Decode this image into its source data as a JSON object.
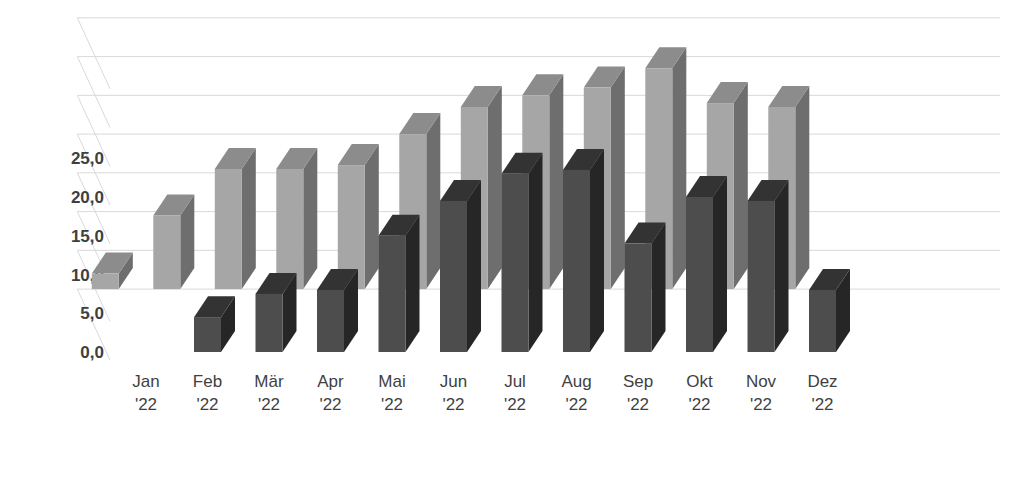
{
  "chart_data": {
    "type": "bar",
    "subtype": "3d-clustered-column-depth",
    "title": "",
    "subtitle": "",
    "xlabel": "",
    "ylabel": "",
    "categories": [
      "Jan\n'22",
      "Feb\n'22",
      "Mär\n'22",
      "Apr\n'22",
      "Mai\n'22",
      "Jun\n'22",
      "Jul\n'22",
      "Aug\n'22",
      "Sep\n'22",
      "Okt\n'22",
      "Nov\n'22",
      "Dez\n'22"
    ],
    "category_month": [
      "Jan",
      "Feb",
      "Mär",
      "Apr",
      "Mai",
      "Jun",
      "Jul",
      "Aug",
      "Sep",
      "Okt",
      "Nov",
      "Dez"
    ],
    "category_year": [
      "'22",
      "'22",
      "'22",
      "'22",
      "'22",
      "'22",
      "'22",
      "'22",
      "'22",
      "'22",
      "'22",
      "'22"
    ],
    "series": [
      {
        "name": "back-series",
        "depth_position": "back",
        "color": "#a6a6a6",
        "side_color": "#6e6e6e",
        "top_color": "#8c8c8c",
        "values": [
          2.0,
          9.5,
          15.5,
          15.5,
          16.0,
          20.0,
          23.5,
          25.0,
          26.0,
          28.5,
          24.0,
          23.5
        ]
      },
      {
        "name": "front-series",
        "depth_position": "front",
        "color": "#4d4d4d",
        "side_color": "#262626",
        "top_color": "#333333",
        "values": [
          0.0,
          4.5,
          7.5,
          8.0,
          15.0,
          19.5,
          23.0,
          23.5,
          14.0,
          20.0,
          19.5,
          8.0
        ]
      }
    ],
    "ylim": [
      0,
      40
    ],
    "yticks": [
      0,
      5,
      10,
      15,
      20,
      25
    ],
    "ytick_labels": [
      "0,0",
      "5,0",
      "10,0",
      "15,0",
      "20,0",
      "25,0"
    ],
    "gridlines": true,
    "gridline_count": 8,
    "legend": null,
    "legend_position": "none",
    "decimal_separator": ",",
    "locale": "de-DE",
    "background_color": "#ffffff",
    "grid_color": "#d9d9d9",
    "tick_label_color": "#3f3f3f"
  }
}
